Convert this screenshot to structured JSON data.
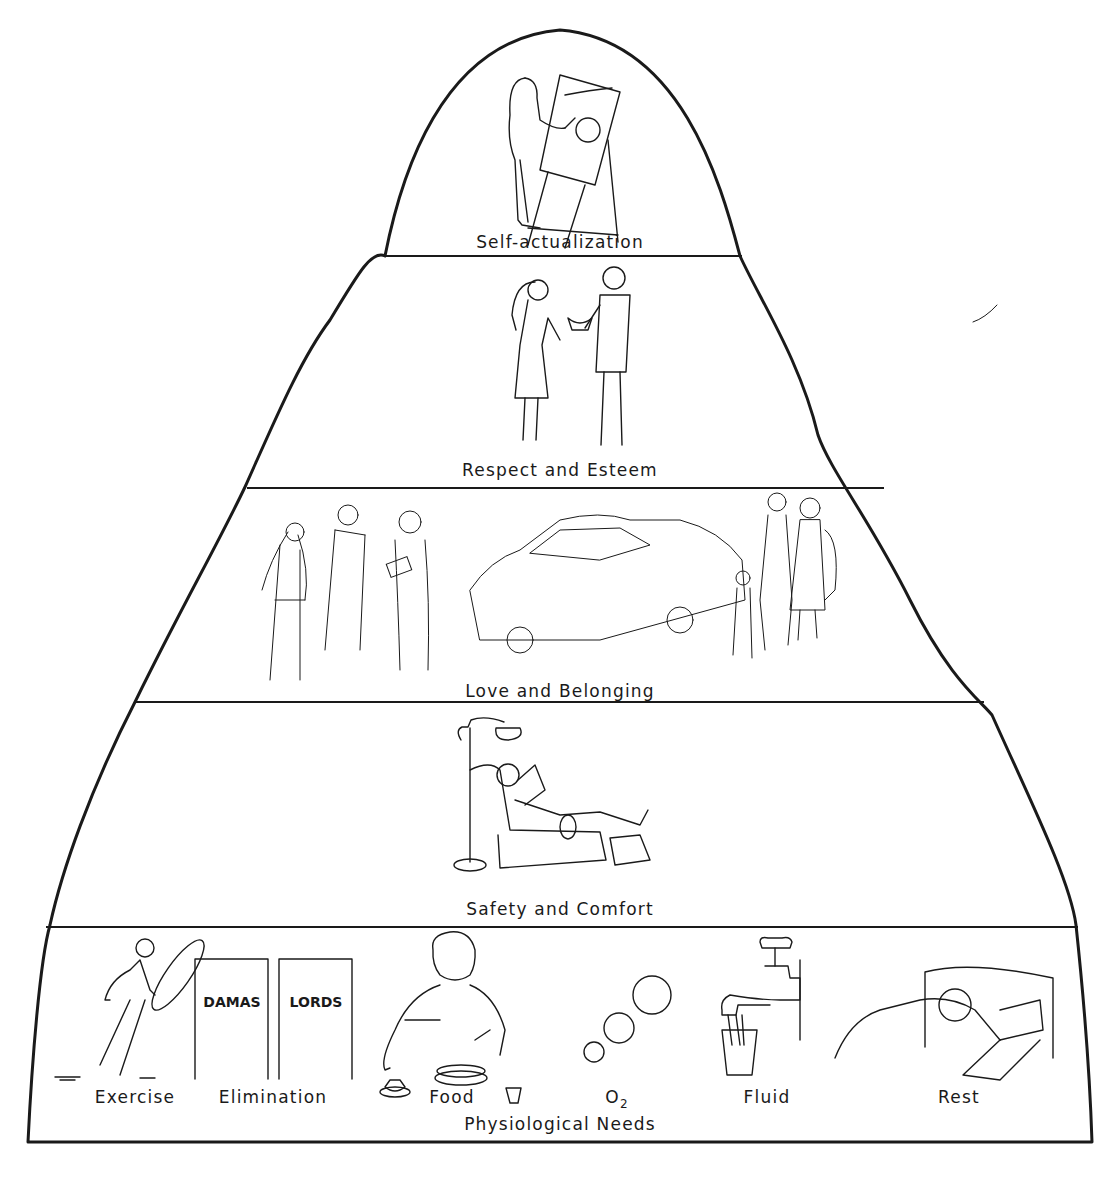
{
  "diagram": {
    "type": "hierarchy-of-needs-pyramid",
    "levels": [
      {
        "label": "Self-actualization",
        "illustration": "woman painting at easel"
      },
      {
        "label": "Respect and Esteem",
        "illustration": "man presenting trophy to woman"
      },
      {
        "label": "Love and Belonging",
        "illustration": "wedding couple with minister; family beside car"
      },
      {
        "label": "Safety and Comfort",
        "illustration": "person reading in recliner under floor lamp"
      },
      {
        "label": "Physiological Needs",
        "illustration": "basic needs row"
      }
    ],
    "physiological_items": [
      {
        "label": "Exercise",
        "icon": "person-with-hoop"
      },
      {
        "label": "Elimination",
        "icon": "restroom-doors"
      },
      {
        "label": "Food",
        "icon": "person-eating"
      },
      {
        "label": "O",
        "subscript": "2",
        "icon": "oxygen-bubbles"
      },
      {
        "label": "Fluid",
        "icon": "faucet-and-glass"
      },
      {
        "label": "Rest",
        "icon": "person-in-bed"
      }
    ],
    "restroom_signs": {
      "left": "DAMAS",
      "right": "LORDS"
    }
  }
}
